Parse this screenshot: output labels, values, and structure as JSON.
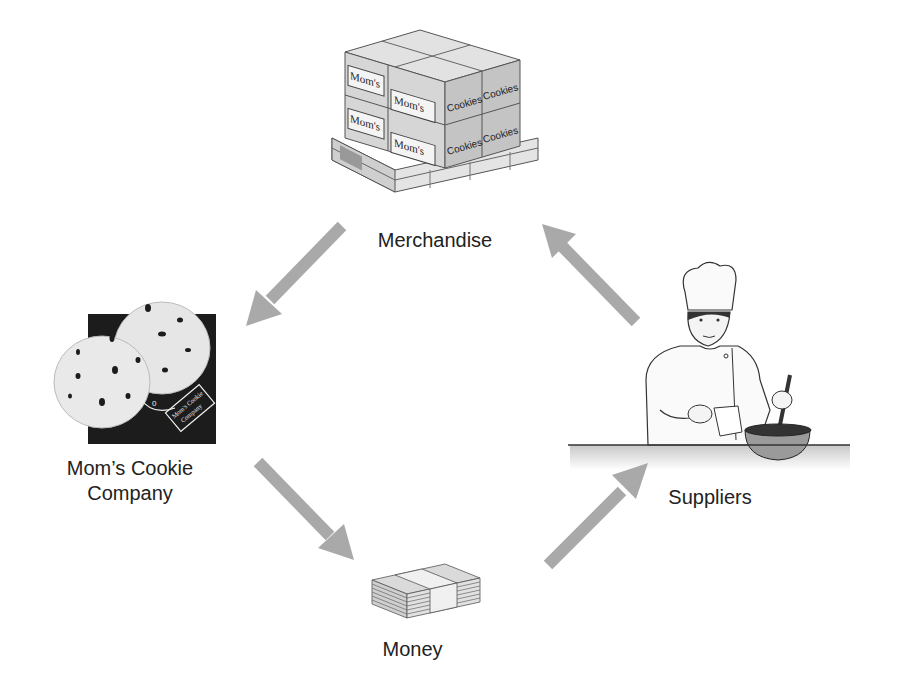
{
  "diagram": {
    "type": "flow-cycle",
    "nodes": [
      {
        "id": "merchandise",
        "label": "Merchandise",
        "illustration": "pallet-of-boxes",
        "box_labels": [
          "Mom's",
          "Mom's",
          "Mom's",
          "Mom's",
          "Cookies",
          "Cookies",
          "Cookies",
          "Cookies"
        ]
      },
      {
        "id": "company",
        "label_line1": "Mom’s Cookie",
        "label_line2": "Company",
        "illustration": "cookies-logo",
        "logo_text": "Mom's Cookie Company"
      },
      {
        "id": "money",
        "label": "Money",
        "illustration": "stack-of-bills"
      },
      {
        "id": "suppliers",
        "label": "Suppliers",
        "illustration": "chef-mixing-bowl"
      }
    ],
    "edges": [
      {
        "from": "suppliers",
        "to": "merchandise",
        "icon": "arrow-up-left"
      },
      {
        "from": "merchandise",
        "to": "company",
        "icon": "arrow-down-left"
      },
      {
        "from": "company",
        "to": "money",
        "icon": "arrow-down-right"
      },
      {
        "from": "money",
        "to": "suppliers",
        "icon": "arrow-up-right"
      }
    ],
    "colors": {
      "arrow": "#a9a9a9",
      "ink": "#222222",
      "logo_bg": "#1a1a1a",
      "box": "#d2d2d2"
    }
  }
}
